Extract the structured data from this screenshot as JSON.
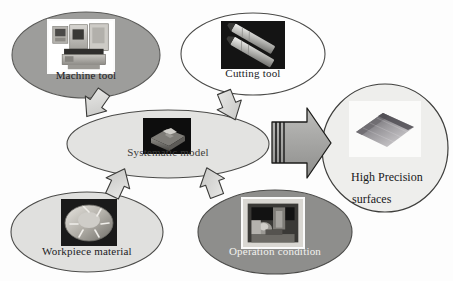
{
  "diagram": {
    "type": "block-flow-diagram",
    "background_color": "#fdfdfd",
    "nodes": [
      {
        "id": "machine-tool",
        "label": "Machine tool",
        "shape": "ellipse",
        "fill": "#9d9d9b",
        "stroke": "#5a5a58",
        "text_color": "#20201f",
        "cx": 86,
        "cy": 55,
        "rx": 74,
        "ry": 43,
        "label_x": 86,
        "label_y": 76,
        "font_size": 11,
        "image": {
          "name": "machine-tool-photo",
          "kind": "cnc-machine",
          "x": 47,
          "y": 19,
          "w": 68,
          "h": 55,
          "framed": true
        }
      },
      {
        "id": "cutting-tool",
        "label": "Cutting tool",
        "shape": "ellipse",
        "fill": "#fefefe",
        "stroke": "#4b4b49",
        "text_color": "#20201f",
        "cx": 253,
        "cy": 54,
        "rx": 72,
        "ry": 41,
        "label_x": 253,
        "label_y": 74,
        "font_size": 11,
        "image": {
          "name": "cutting-tool-photo",
          "kind": "end-mills",
          "x": 221,
          "y": 21,
          "w": 64,
          "h": 48,
          "framed": false
        }
      },
      {
        "id": "systematic-model",
        "label": "Systematic model",
        "shape": "ellipse",
        "fill": "#e3e3e1",
        "stroke": "#4b4b49",
        "text_color": "#3c3c3a",
        "cx": 168,
        "cy": 144,
        "rx": 101,
        "ry": 34,
        "label_x": 168,
        "label_y": 153,
        "font_size": 11,
        "image": {
          "name": "systematic-model-photo",
          "kind": "machined-block",
          "x": 143,
          "y": 118,
          "w": 48,
          "h": 36,
          "framed": false
        }
      },
      {
        "id": "workpiece-material",
        "label": "Workpiece material",
        "shape": "ellipse",
        "fill": "#e0e0de",
        "stroke": "#4b4b49",
        "text_color": "#20201f",
        "cx": 87,
        "cy": 232,
        "rx": 76,
        "ry": 40,
        "label_x": 87,
        "label_y": 252,
        "font_size": 11,
        "image": {
          "name": "workpiece-material-photo",
          "kind": "turbine-disc",
          "x": 61,
          "y": 199,
          "w": 56,
          "h": 47,
          "framed": false
        }
      },
      {
        "id": "operation-condition",
        "label": "Operation condition",
        "shape": "ellipse",
        "fill": "#8e8e8c",
        "stroke": "#4b4b49",
        "text_color": "#f2f2ef",
        "cx": 275,
        "cy": 232,
        "rx": 77,
        "ry": 42,
        "label_x": 275,
        "label_y": 252,
        "font_size": 11,
        "image": {
          "name": "operation-condition-photo",
          "kind": "machining-setup",
          "x": 241,
          "y": 197,
          "w": 64,
          "h": 52,
          "framed": true
        }
      },
      {
        "id": "high-precision-surfaces",
        "label": "High Precision surfaces",
        "label_lines": [
          "High Precision",
          "surfaces"
        ],
        "shape": "ellipse",
        "fill": "#eeeeec",
        "stroke": "#3f3f3d",
        "text_color": "#18181a",
        "cx": 385,
        "cy": 148,
        "rx": 63,
        "ry": 64,
        "font_size": 12,
        "image": {
          "name": "surface-topography-photo",
          "kind": "surface-plot",
          "x": 349,
          "y": 101,
          "w": 72,
          "h": 56,
          "framed": false
        }
      }
    ],
    "connectors": [
      {
        "id": "arrow-machine-to-model",
        "name": "arrow-machine-tool-to-model",
        "from": "machine-tool",
        "to": "systematic-model",
        "direction": "down-right",
        "style": "block-arrow",
        "fill": "#d9d9d7",
        "stroke": "#3a3a38"
      },
      {
        "id": "arrow-cutting-to-model",
        "name": "arrow-cutting-tool-to-model",
        "from": "cutting-tool",
        "to": "systematic-model",
        "direction": "down-left",
        "style": "block-arrow",
        "fill": "#d9d9d7",
        "stroke": "#3a3a38"
      },
      {
        "id": "arrow-workpiece-to-model",
        "name": "arrow-workpiece-material-to-model",
        "from": "workpiece-material",
        "to": "systematic-model",
        "direction": "up-right",
        "style": "block-arrow",
        "fill": "#d9d9d7",
        "stroke": "#3a3a38"
      },
      {
        "id": "arrow-operation-to-model",
        "name": "arrow-operation-condition-to-model",
        "from": "operation-condition",
        "to": "systematic-model",
        "direction": "up-left",
        "style": "block-arrow",
        "fill": "#d9d9d7",
        "stroke": "#3a3a38"
      },
      {
        "id": "arrow-model-to-output",
        "name": "arrow-model-to-high-precision-surfaces",
        "from": "systematic-model",
        "to": "high-precision-surfaces",
        "direction": "right",
        "style": "striped-block-arrow",
        "fill": "#a8a8a6",
        "stroke": "#1d1d1b"
      }
    ]
  }
}
